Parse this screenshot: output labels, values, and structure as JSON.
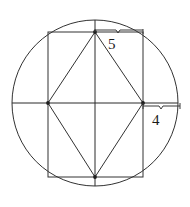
{
  "figure": {
    "background_color": "#ffffff",
    "line_color": "#2b2b2b",
    "label_color": "#1a1a1a",
    "circle": {
      "center_x": 95,
      "center_y": 103,
      "radius": 83
    },
    "rectangle": {
      "left": 48,
      "top": 32,
      "right": 143,
      "bottom": 177,
      "width": 95,
      "height": 145
    },
    "rhombus": {
      "top_vertex": [
        95,
        32
      ],
      "right_vertex": [
        143,
        103
      ],
      "bottom_vertex": [
        95,
        177
      ],
      "left_vertex": [
        48,
        103
      ]
    },
    "diameters": {
      "horizontal_y": 103,
      "vertical_x": 95
    },
    "dimensions": [
      {
        "name": "top-segment",
        "label": "5",
        "value": 5,
        "from": [
          95,
          31
        ],
        "to": [
          143,
          31
        ],
        "orientation": "horizontal",
        "label_position": [
          108,
          37
        ]
      },
      {
        "name": "right-segment",
        "label": "4",
        "value": 4,
        "from": [
          143,
          107
        ],
        "to": [
          180,
          107
        ],
        "orientation": "horizontal",
        "label_position": [
          152,
          113
        ]
      }
    ]
  }
}
